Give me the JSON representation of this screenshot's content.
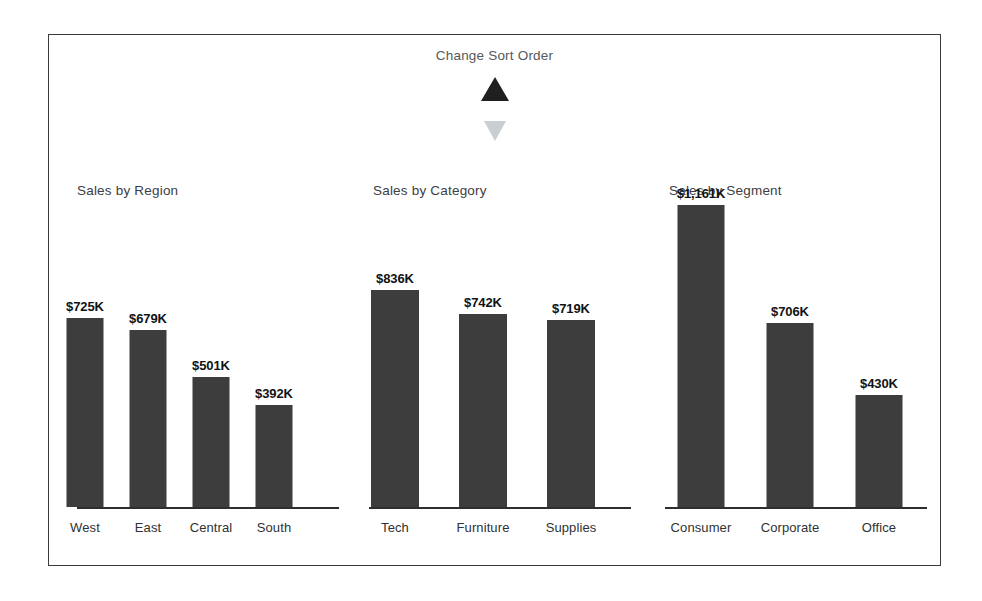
{
  "sort_control": {
    "title": "Change Sort Order",
    "ascending_icon": "triangle-up-icon",
    "descending_icon": "triangle-down-icon",
    "active": "ascending",
    "active_color": "#1f1f1f",
    "inactive_color": "#c9ced1"
  },
  "theme": {
    "bar_color": "#3d3d3d",
    "axis_color": "#2e2e2e",
    "border_color": "#3a3a3a",
    "title_color": "#3d4043",
    "value_color": "#111314",
    "background": "#ffffff"
  },
  "chart_data": [
    {
      "type": "bar",
      "title": "Sales by Region",
      "xlabel": "",
      "ylabel": "",
      "ylim": [
        0,
        1161
      ],
      "grid": false,
      "legend": false,
      "categories": [
        "West",
        "East",
        "Central",
        "South"
      ],
      "values": [
        725,
        679,
        501,
        392
      ],
      "value_labels": [
        "$725K",
        "$679K",
        "$501K",
        "$392K"
      ],
      "unit": "K USD",
      "sort_order": "descending"
    },
    {
      "type": "bar",
      "title": "Sales by Category",
      "xlabel": "",
      "ylabel": "",
      "ylim": [
        0,
        1161
      ],
      "grid": false,
      "legend": false,
      "categories": [
        "Tech",
        "Furniture",
        "Supplies"
      ],
      "values": [
        836,
        742,
        719
      ],
      "value_labels": [
        "$836K",
        "$742K",
        "$719K"
      ],
      "unit": "K USD",
      "sort_order": "descending"
    },
    {
      "type": "bar",
      "title": "Sales by Segment",
      "xlabel": "",
      "ylabel": "",
      "ylim": [
        0,
        1161
      ],
      "grid": false,
      "legend": false,
      "categories": [
        "Consumer",
        "Corporate",
        "Office"
      ],
      "values": [
        1161,
        706,
        430
      ],
      "value_labels": [
        "$1,161K",
        "$706K",
        "$430K"
      ],
      "unit": "K USD",
      "sort_order": "descending"
    }
  ]
}
